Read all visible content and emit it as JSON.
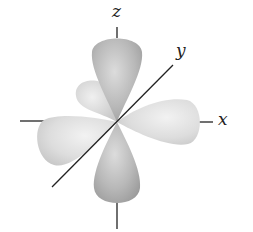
{
  "diagram": {
    "type": "d-orbital (d_xz)",
    "axes": {
      "x_label": "x",
      "y_label": "y",
      "z_label": "z"
    },
    "lobes": [
      "+z",
      "-z",
      "+x",
      "-x",
      "back-lobe"
    ],
    "colors": {
      "lobe_fill_dark": "#9a9a9a",
      "lobe_fill_light": "#e6e6e6",
      "axis": "#222222",
      "background": "#ffffff"
    }
  }
}
